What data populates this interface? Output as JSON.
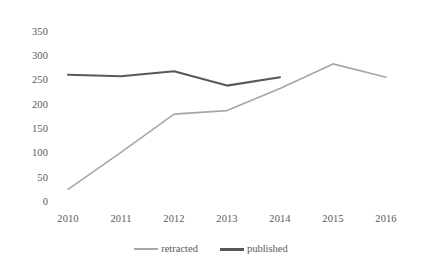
{
  "chart_data": {
    "type": "line",
    "title": "",
    "subtitle": "",
    "xlabel": "",
    "ylabel": "",
    "categories": [
      "2010",
      "2011",
      "2012",
      "2013",
      "2014",
      "2015",
      "2016"
    ],
    "x": [
      2010,
      2011,
      2012,
      2013,
      2014,
      2015,
      2016
    ],
    "series": [
      {
        "name": "retracted",
        "color": "#a6a6a6",
        "line_width": 2,
        "values": [
          30,
          105,
          183,
          190,
          235,
          285,
          258
        ]
      },
      {
        "name": "published",
        "color": "#595959",
        "line_width": 3,
        "values": [
          263,
          260,
          270,
          241,
          258,
          null,
          null
        ]
      }
    ],
    "ylim": [
      0,
      350
    ],
    "ytick_labels": [
      "0",
      "50",
      "100",
      "150",
      "200",
      "250",
      "300",
      "350"
    ],
    "ytick_values": [
      0,
      50,
      100,
      150,
      200,
      250,
      300,
      350
    ],
    "xtick_labels": [
      "2010",
      "2011",
      "2012",
      "2013",
      "2014",
      "2015",
      "2016"
    ],
    "grid": false,
    "legend": [
      "retracted",
      "published"
    ],
    "legend_position": "bottom-center"
  },
  "legend": {
    "entries": [
      {
        "label": "retracted",
        "swatch": "line-swatch-light-gray"
      },
      {
        "label": "published",
        "swatch": "line-swatch-dark-gray"
      }
    ]
  },
  "axes": {
    "y_ticks": [
      {
        "label": "350"
      },
      {
        "label": "300"
      },
      {
        "label": "250"
      },
      {
        "label": "200"
      },
      {
        "label": "150"
      },
      {
        "label": "100"
      },
      {
        "label": "50"
      },
      {
        "label": "0"
      }
    ],
    "x_ticks": [
      {
        "label": "2010"
      },
      {
        "label": "2011"
      },
      {
        "label": "2012"
      },
      {
        "label": "2013"
      },
      {
        "label": "2014"
      },
      {
        "label": "2015"
      },
      {
        "label": "2016"
      }
    ]
  },
  "colors": {
    "retracted_line": "#a6a6a6",
    "published_line": "#595959",
    "tick_text": "#595959",
    "background": "#ffffff"
  }
}
